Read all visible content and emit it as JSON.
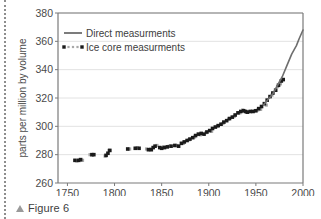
{
  "caption": {
    "marker": "triangle-up-icon",
    "text": "Figure 6"
  },
  "chart_data": {
    "type": "scatter",
    "title": "",
    "xlabel": "",
    "ylabel": "parts per million by volume",
    "xlim": [
      1740,
      2000
    ],
    "ylim": [
      260,
      380
    ],
    "xticks": [
      1750,
      1800,
      1850,
      1900,
      1950,
      2000
    ],
    "yticks": [
      260,
      280,
      300,
      320,
      340,
      360,
      380
    ],
    "grid": "horizontal",
    "legend_position": "top-left",
    "colors": {
      "direct_line": "#6e6e6e",
      "ice_core_dark": "#1a1a1a",
      "ice_core_light": "#a8a8a8",
      "axis": "#7a7a7a",
      "grid": "#e2e2e2"
    },
    "series": [
      {
        "name": "Direct measurments",
        "style": "line",
        "color": "#6e6e6e",
        "x": [
          1958,
          1963,
          1968,
          1973,
          1978,
          1983,
          1988,
          1993,
          1996,
          1998,
          2000
        ],
        "values": [
          315,
          319,
          323,
          329,
          335,
          343,
          351,
          357,
          362,
          365,
          368
        ]
      },
      {
        "name": "Ice core measurments",
        "style": "markers",
        "color": "#1a1a1a",
        "x": [
          1758,
          1762,
          1764,
          1776,
          1778,
          1791,
          1793,
          1795,
          1814,
          1822,
          1826,
          1836,
          1839,
          1841,
          1843,
          1848,
          1850,
          1853,
          1856,
          1860,
          1864,
          1868,
          1871,
          1874,
          1877,
          1880,
          1883,
          1886,
          1889,
          1892,
          1895,
          1898,
          1901,
          1904,
          1907,
          1910,
          1913,
          1916,
          1919,
          1922,
          1925,
          1928,
          1931,
          1934,
          1937,
          1939,
          1941,
          1944,
          1947,
          1950,
          1953,
          1956,
          1959,
          1962,
          1965,
          1968,
          1971,
          1974,
          1977,
          1979
        ],
        "values": [
          276,
          276,
          276.5,
          280,
          280,
          279.5,
          281,
          283,
          284,
          284.5,
          284.5,
          283.5,
          283.5,
          285,
          286,
          285,
          284.5,
          285,
          285.5,
          286,
          286.5,
          286,
          288,
          289,
          290,
          291,
          292,
          293.5,
          294.5,
          295,
          294.5,
          296,
          297,
          298.5,
          299.5,
          300.5,
          301.5,
          303,
          304,
          305.5,
          306.5,
          308,
          309.5,
          310.5,
          311,
          310.5,
          310,
          310.5,
          310.5,
          311,
          312.5,
          314,
          316,
          318.5,
          321,
          323.5,
          325.5,
          329,
          332,
          333
        ]
      },
      {
        "name": "Ice core measurments (light)",
        "style": "markers-light",
        "color": "#a8a8a8",
        "x": [
          1760,
          1766,
          1774,
          1790,
          1794,
          1816,
          1824,
          1834,
          1838,
          1845,
          1852,
          1858,
          1866,
          1873,
          1879,
          1885,
          1891,
          1897,
          1903,
          1909,
          1915,
          1921,
          1927,
          1933,
          1936,
          1940,
          1945,
          1949,
          1952,
          1955,
          1961,
          1967,
          1973,
          1976
        ],
        "values": [
          275.5,
          276,
          280,
          279,
          283,
          284,
          285,
          284,
          284,
          286.5,
          285.5,
          286,
          286.5,
          288,
          290.5,
          292.5,
          294,
          295.5,
          296.5,
          300,
          302,
          305,
          307,
          309.5,
          311.5,
          310,
          310.5,
          311,
          311.5,
          312,
          315,
          322,
          328,
          330
        ]
      }
    ]
  }
}
